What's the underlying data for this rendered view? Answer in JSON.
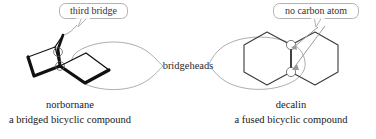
{
  "figure": {
    "background": "#ffffff",
    "ink": "#111111",
    "thin_line": "#8a8a8a",
    "callout_border": "#a9a9a9",
    "callout_fill": "#ffffff",
    "callout_text_color": "#333333"
  },
  "callouts": [
    {
      "id": "third-bridge",
      "label": "third bridge",
      "points_to": "bridge-apex-of-norbornane"
    },
    {
      "id": "no-carbon-atom",
      "label": "no carbon atom",
      "points_to": "fusion-bond-of-decalin"
    }
  ],
  "shared_label": {
    "id": "bridgeheads",
    "label": "bridgeheads"
  },
  "structures": [
    {
      "id": "norbornane",
      "name": "norbornane",
      "description": "a bridged bicyclic compound",
      "rendering": "bold-3d-skeletal",
      "bridgehead_markers": 2,
      "circled_atoms": [
        "top-bridgehead",
        "bottom-bridgehead"
      ]
    },
    {
      "id": "decalin",
      "name": "decalin",
      "description": "a fused bicyclic compound",
      "rendering": "thin-line-fused-hexagons",
      "bridgehead_markers": 2,
      "circled_atoms": [
        "upper-fusion-carbon",
        "lower-fusion-carbon"
      ]
    }
  ]
}
